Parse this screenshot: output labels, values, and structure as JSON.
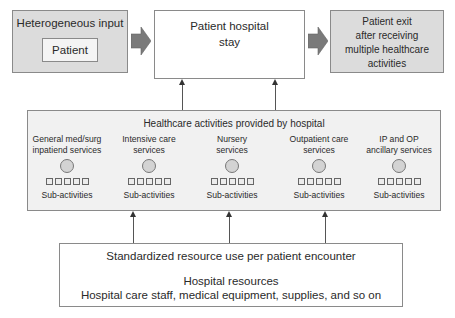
{
  "input_box": {
    "title": "Heterogeneous input",
    "inner_label": "Patient"
  },
  "stay_box": {
    "line1": "Patient hospital",
    "line2": "stay"
  },
  "exit_box": {
    "lines": [
      "Patient exit",
      "after receiving",
      "multiple healthcare",
      "activities"
    ]
  },
  "activities_panel": {
    "title": "Healthcare activities provided by hospital",
    "columns": [
      {
        "name_line1": "General med/surg",
        "name_line2": "inpatiend services",
        "sub_label": "Sub-activities"
      },
      {
        "name_line1": "Intensive care",
        "name_line2": "services",
        "sub_label": "Sub-activities"
      },
      {
        "name_line1": "Nursery",
        "name_line2": "services",
        "sub_label": "Sub-activities"
      },
      {
        "name_line1": "Outpatient care",
        "name_line2": "services",
        "sub_label": "Sub-activities"
      },
      {
        "name_line1": "IP and OP",
        "name_line2": "ancillary services",
        "sub_label": "Sub-activities"
      }
    ]
  },
  "resources_box": {
    "line1": "Standardized resource use per patient encounter",
    "line2": "Hospital resources",
    "line3": "Hospital care staff, medical equipment, supplies, and so on"
  },
  "colors": {
    "gray_fill": "#dcdcdc",
    "panel_fill": "#f1f1f1",
    "arrow_fill": "#7a7a7a",
    "border": "#8a8a8a"
  }
}
